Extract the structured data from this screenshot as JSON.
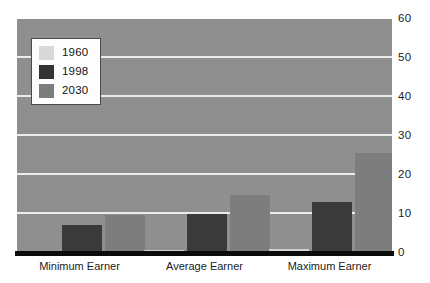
{
  "chart_data": {
    "type": "bar",
    "title": "",
    "xlabel": "",
    "ylabel": "",
    "categories": [
      "Minimum Earner",
      "Average Earner",
      "Maximum Earner"
    ],
    "series": [
      {
        "name": "1960",
        "color": "#d2d2d2",
        "values": [
          0.4,
          0.7,
          1.0
        ]
      },
      {
        "name": "1998",
        "color": "#3a3a3a",
        "values": [
          7.2,
          10.0,
          13.0
        ]
      },
      {
        "name": "2030",
        "color": "#7d7d7d",
        "values": [
          9.7,
          15.0,
          25.7
        ]
      }
    ],
    "ylim": [
      0,
      60
    ],
    "yticks": [
      0,
      10,
      20,
      30,
      40,
      50,
      60
    ],
    "ytick_labels": [
      "0",
      "10",
      "20",
      "30",
      "40",
      "50",
      "60"
    ],
    "grid": true,
    "grid_color": "#ececeb",
    "legend_position": "top-left",
    "plot_background": "#8f8f8f",
    "axis_color": "#0b0b0b"
  },
  "legend": {
    "items": [
      {
        "label": "1960"
      },
      {
        "label": "1998"
      },
      {
        "label": "2030"
      }
    ]
  },
  "y_axis": {
    "ticks": [
      "0",
      "10",
      "20",
      "30",
      "40",
      "50",
      "60"
    ]
  },
  "x_axis": {
    "categories": [
      "Minimum Earner",
      "Average Earner",
      "Maximum Earner"
    ]
  }
}
